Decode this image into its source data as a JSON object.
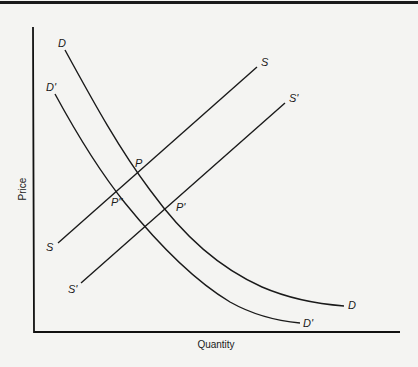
{
  "diagram": {
    "type": "supply-demand",
    "axes": {
      "x_label": "Quantity",
      "y_label": "Price"
    },
    "curves": [
      {
        "id": "D",
        "label": "D",
        "label_end": "D",
        "kind": "demand"
      },
      {
        "id": "D_prime",
        "label": "D'",
        "label_end": "D'",
        "kind": "demand"
      },
      {
        "id": "S",
        "label": "S",
        "label_end": "S",
        "kind": "supply"
      },
      {
        "id": "S_prime",
        "label": "S'",
        "label_end": "S'",
        "kind": "supply"
      }
    ],
    "points": [
      {
        "id": "P",
        "label": "P",
        "intersection": [
          "D",
          "S"
        ]
      },
      {
        "id": "P_double_prime",
        "label": "P''",
        "intersection": [
          "D'",
          "S"
        ]
      },
      {
        "id": "P_prime",
        "label": "P'",
        "intersection": [
          "D",
          "S'"
        ]
      }
    ]
  }
}
